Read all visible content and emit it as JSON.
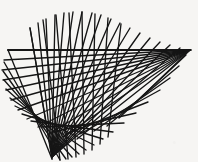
{
  "figure": {
    "type": "line-envelope",
    "canvas": {
      "width": 198,
      "height": 162
    },
    "background_color": "#f6f5f3",
    "line_color": "#151515",
    "line_width": 1.35,
    "line_count": 26,
    "construction": {
      "method": "sliding-rod",
      "note": "Each segment joins a point on the vertical rail to a point on the horizontal rail; constant-length family generates an astroid envelope.",
      "vertical_rail": {
        "x": 52,
        "y_top": 12,
        "y_bottom": 159
      },
      "horizontal_rail": {
        "y": 50,
        "x_left": 8,
        "x_right": 191
      },
      "pivot_point": {
        "x": 52,
        "y": 50
      },
      "fan_origin_top": {
        "x": 52,
        "y": 155
      },
      "fan_origin_right": {
        "x": 190,
        "y": 50
      }
    },
    "axes": {
      "horizontal_line": {
        "x1": 8,
        "y1": 50,
        "x2": 191,
        "y2": 50,
        "label": "horizontal-rail"
      },
      "vertical_cluster": {
        "x1": 52,
        "y1": 159,
        "x2": 52,
        "y2": 14,
        "label": "vertical-rail"
      }
    },
    "segments": [
      {
        "x1": 8,
        "y1": 50,
        "x2": 52,
        "y2": 159
      },
      {
        "x1": 8,
        "y1": 50,
        "x2": 191,
        "y2": 50
      },
      {
        "x1": 4,
        "y1": 62,
        "x2": 60,
        "y2": 160
      },
      {
        "x1": 3,
        "y1": 71,
        "x2": 66,
        "y2": 159
      },
      {
        "x1": 4,
        "y1": 80,
        "x2": 72,
        "y2": 157
      },
      {
        "x1": 6,
        "y1": 89,
        "x2": 79,
        "y2": 154
      },
      {
        "x1": 10,
        "y1": 98,
        "x2": 86,
        "y2": 150
      },
      {
        "x1": 15,
        "y1": 106,
        "x2": 94,
        "y2": 145
      },
      {
        "x1": 22,
        "y1": 114,
        "x2": 103,
        "y2": 139
      },
      {
        "x1": 31,
        "y1": 121,
        "x2": 113,
        "y2": 132
      },
      {
        "x1": 41,
        "y1": 127,
        "x2": 124,
        "y2": 123
      },
      {
        "x1": 53,
        "y1": 132,
        "x2": 136,
        "y2": 113
      },
      {
        "x1": 66,
        "y1": 134,
        "x2": 148,
        "y2": 102
      },
      {
        "x1": 80,
        "y1": 134,
        "x2": 160,
        "y2": 90
      },
      {
        "x1": 94,
        "y1": 131,
        "x2": 170,
        "y2": 78
      },
      {
        "x1": 107,
        "y1": 126,
        "x2": 179,
        "y2": 66
      },
      {
        "x1": 119,
        "y1": 118,
        "x2": 186,
        "y2": 55
      },
      {
        "x1": 130,
        "y1": 108,
        "x2": 190,
        "y2": 50
      },
      {
        "x1": 30,
        "y1": 28,
        "x2": 52,
        "y2": 159
      },
      {
        "x1": 43,
        "y1": 20,
        "x2": 60,
        "y2": 160
      },
      {
        "x1": 56,
        "y1": 15,
        "x2": 68,
        "y2": 159
      },
      {
        "x1": 69,
        "y1": 13,
        "x2": 76,
        "y2": 157
      },
      {
        "x1": 82,
        "y1": 12,
        "x2": 84,
        "y2": 154
      },
      {
        "x1": 95,
        "y1": 14,
        "x2": 92,
        "y2": 150
      },
      {
        "x1": 108,
        "y1": 18,
        "x2": 100,
        "y2": 144
      },
      {
        "x1": 121,
        "y1": 24,
        "x2": 108,
        "y2": 137
      }
    ],
    "fan_top": {
      "apex": {
        "x": 52,
        "y": 157
      },
      "note": "Near-vertical pencil of lines converging at the bottom cluster",
      "tips": [
        {
          "x": 30,
          "y": 28
        },
        {
          "x": 38,
          "y": 23
        },
        {
          "x": 46,
          "y": 19
        },
        {
          "x": 55,
          "y": 15
        },
        {
          "x": 64,
          "y": 13
        },
        {
          "x": 73,
          "y": 12
        },
        {
          "x": 82,
          "y": 12
        },
        {
          "x": 92,
          "y": 13
        },
        {
          "x": 101,
          "y": 15
        },
        {
          "x": 111,
          "y": 19
        },
        {
          "x": 120,
          "y": 23
        },
        {
          "x": 130,
          "y": 28
        },
        {
          "x": 140,
          "y": 33
        },
        {
          "x": 150,
          "y": 38
        },
        {
          "x": 160,
          "y": 42
        },
        {
          "x": 170,
          "y": 45
        },
        {
          "x": 180,
          "y": 48
        }
      ]
    },
    "fan_left": {
      "apex": {
        "x": 190,
        "y": 50
      },
      "note": "Pencil of lines converging at the right end of the horizontal rail",
      "tips": [
        {
          "x": 8,
          "y": 50
        },
        {
          "x": 4,
          "y": 60
        },
        {
          "x": 2,
          "y": 70
        },
        {
          "x": 3,
          "y": 80
        },
        {
          "x": 6,
          "y": 90
        },
        {
          "x": 11,
          "y": 100
        },
        {
          "x": 18,
          "y": 110
        },
        {
          "x": 27,
          "y": 119
        },
        {
          "x": 38,
          "y": 127
        },
        {
          "x": 50,
          "y": 133
        },
        {
          "x": 63,
          "y": 137
        },
        {
          "x": 77,
          "y": 139
        }
      ]
    },
    "envelope_curve": {
      "shape": "astroid-arc",
      "path_points": [
        {
          "x": 52,
          "y": 159
        },
        {
          "x": 57,
          "y": 140
        },
        {
          "x": 64,
          "y": 122
        },
        {
          "x": 73,
          "y": 106
        },
        {
          "x": 84,
          "y": 92
        },
        {
          "x": 97,
          "y": 79
        },
        {
          "x": 112,
          "y": 68
        },
        {
          "x": 130,
          "y": 59
        },
        {
          "x": 150,
          "y": 53
        },
        {
          "x": 170,
          "y": 50
        },
        {
          "x": 190,
          "y": 50
        }
      ]
    }
  }
}
